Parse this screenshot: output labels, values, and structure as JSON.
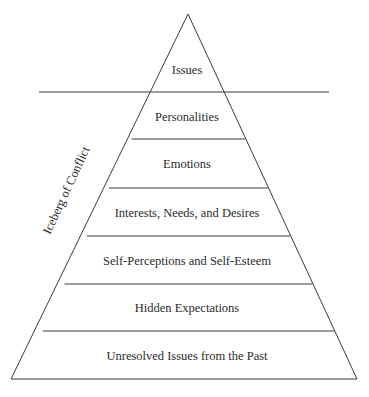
{
  "diagram": {
    "side_label": "Iceberg of Conflict",
    "waterline_label": "",
    "levels": [
      {
        "label": "Issues",
        "visibility": "above-water"
      },
      {
        "label": "Personalities",
        "visibility": "below-water"
      },
      {
        "label": "Emotions",
        "visibility": "below-water"
      },
      {
        "label": "Interests, Needs, and Desires",
        "visibility": "below-water"
      },
      {
        "label": "Self-Perceptions and Self-Esteem",
        "visibility": "below-water"
      },
      {
        "label": "Hidden Expectations",
        "visibility": "below-water"
      },
      {
        "label": "Unresolved Issues from the Past",
        "visibility": "below-water"
      }
    ]
  }
}
